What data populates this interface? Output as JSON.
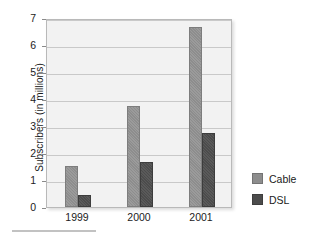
{
  "chart_data": {
    "type": "bar",
    "title": "",
    "xlabel": "",
    "ylabel": "Subscribers (in millions)",
    "categories": [
      "1999",
      "2000",
      "2001"
    ],
    "series": [
      {
        "name": "Cable",
        "values": [
          1.5,
          3.75,
          6.65
        ],
        "color": "#8d8d8d"
      },
      {
        "name": "DSL",
        "values": [
          0.45,
          1.65,
          2.75
        ],
        "color": "#4c4c4c"
      }
    ],
    "ylim": [
      0,
      7
    ],
    "ytick_labels": [
      "0",
      "1",
      "2",
      "3",
      "4",
      "5",
      "6",
      "7"
    ],
    "ytick_values": [
      0,
      1,
      2,
      3,
      4,
      5,
      6,
      7
    ],
    "grid": true,
    "grid_axis": "y",
    "legend_position": "right",
    "plot_background": "#f2f2f2"
  },
  "legend": {
    "items": [
      {
        "label": "Cable",
        "swatch": "cable-color-swatch"
      },
      {
        "label": "DSL",
        "swatch": "dsl-color-swatch"
      }
    ]
  }
}
